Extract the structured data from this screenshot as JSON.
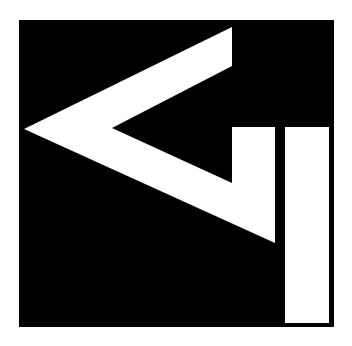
{
  "logo": {
    "description": "Black square logo with white chevron and vertical bars",
    "colors": {
      "background": "#ffffff",
      "square": "#000000",
      "foreground": "#ffffff"
    },
    "square": {
      "x": 19,
      "y": 20,
      "width": 315,
      "height": 307
    },
    "chevron_polygon": "232,27 24,129 275,243 275,127 232,127 232,183 112,128 232,66",
    "bar_right": {
      "x": 285,
      "y": 127,
      "width": 44,
      "height": 196
    }
  }
}
